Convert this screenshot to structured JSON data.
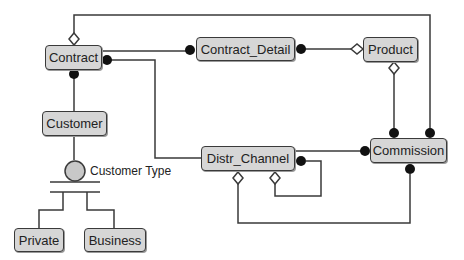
{
  "diagram": {
    "type": "entity-relationship",
    "colors": {
      "entity_fill": "#d6d6d6",
      "line": "#3a3a3a",
      "dot": "#111111"
    },
    "entities": [
      {
        "id": "contract",
        "label": "Contract"
      },
      {
        "id": "contract_detail",
        "label": "Contract_Detail"
      },
      {
        "id": "product",
        "label": "Product"
      },
      {
        "id": "customer",
        "label": "Customer"
      },
      {
        "id": "distr_channel",
        "label": "Distr_Channel"
      },
      {
        "id": "commission",
        "label": "Commission"
      },
      {
        "id": "private",
        "label": "Private"
      },
      {
        "id": "business",
        "label": "Business"
      }
    ],
    "specialization": {
      "label": "Customer Type",
      "parent": "Customer",
      "children": [
        "Private",
        "Business"
      ]
    },
    "relationships": [
      {
        "from": "Contract",
        "to": "Contract_Detail",
        "from_end": "none",
        "to_end": "dot"
      },
      {
        "from": "Contract_Detail",
        "to": "Product",
        "from_end": "dot",
        "to_end": "diamond"
      },
      {
        "from": "Contract",
        "to": "Customer",
        "from_end": "dot",
        "to_end": "none"
      },
      {
        "from": "Contract",
        "to": "Distr_Channel",
        "from_end": "dot",
        "to_end": "none"
      },
      {
        "from": "Contract",
        "to": "Commission",
        "from_end": "diamond",
        "to_end": "dot"
      },
      {
        "from": "Product",
        "to": "Commission",
        "from_end": "diamond",
        "to_end": "dot"
      },
      {
        "from": "Distr_Channel",
        "to": "Commission",
        "from_end": "none",
        "to_end": "dot"
      },
      {
        "from": "Distr_Channel",
        "to": "Distr_Channel",
        "from_end": "dot",
        "to_end": "diamond"
      },
      {
        "from": "Distr_Channel",
        "to": "Commission",
        "from_end": "diamond",
        "to_end": "dot"
      }
    ]
  }
}
